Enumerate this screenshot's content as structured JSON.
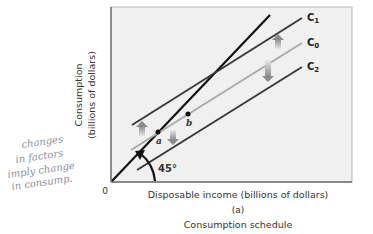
{
  "chart_data": {
    "type": "line",
    "title": "Consumption schedule",
    "panel_label": "(a)",
    "xlabel": "Disposable income (billions of dollars)",
    "ylabel": "Consumption",
    "ylabel2": "(billions of dollars)",
    "origin_label": "0",
    "angle_label": "45°",
    "grid": false,
    "series": [
      {
        "name": "45° line",
        "color": "#111111",
        "points": [
          [
            112,
            181
          ],
          [
            270,
            15
          ]
        ]
      },
      {
        "name": "C1",
        "label": "C",
        "sub": "1",
        "color": "#3a3a3a",
        "points": [
          [
            132,
            125
          ],
          [
            302,
            18
          ]
        ]
      },
      {
        "name": "C0",
        "label": "C",
        "sub": "0",
        "color": "#aaaaaa",
        "points": [
          [
            131,
            150
          ],
          [
            302,
            43
          ]
        ]
      },
      {
        "name": "C2",
        "label": "C",
        "sub": "2",
        "color": "#3a3a3a",
        "points": [
          [
            137,
            170
          ],
          [
            302,
            67
          ]
        ]
      }
    ],
    "points": [
      {
        "label": "a",
        "x": 158,
        "y": 132
      },
      {
        "label": "b",
        "x": 188,
        "y": 114
      }
    ],
    "shifts": [
      {
        "direction": "up",
        "x": 142,
        "y1": 136,
        "y2": 121
      },
      {
        "direction": "down",
        "x": 173,
        "y1": 130,
        "y2": 145
      },
      {
        "direction": "up",
        "x": 278,
        "y1": 49,
        "y2": 34
      },
      {
        "direction": "down",
        "x": 268,
        "y1": 60,
        "y2": 82
      }
    ]
  },
  "annotation": {
    "lines": [
      "changes",
      "in factors",
      "imply change",
      "in consump."
    ]
  }
}
